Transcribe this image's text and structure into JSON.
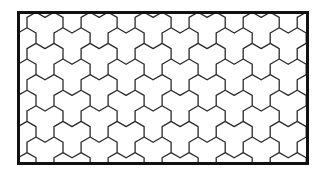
{
  "figure": {
    "tile_type": "tri-hex",
    "colors": {
      "background": "#ffffff",
      "line": "#2a2a2a",
      "frame": "#111111"
    },
    "frame": {
      "x": 17,
      "y": 11,
      "width": 292,
      "height": 154,
      "stroke_width": 3
    },
    "grid": {
      "hex_size": 10.4,
      "line_width": 1.3
    }
  }
}
